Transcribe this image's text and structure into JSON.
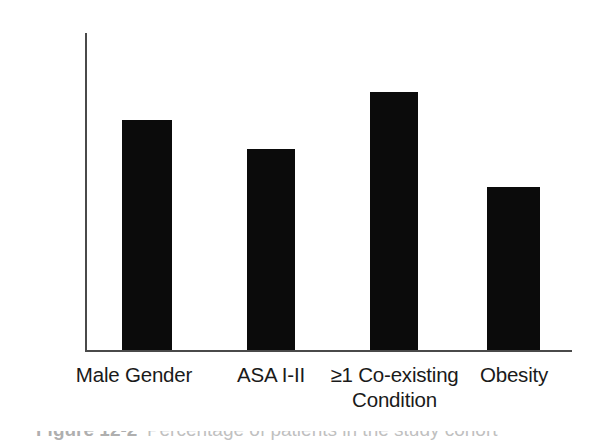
{
  "chart_data": {
    "type": "bar",
    "title": "",
    "subtitle": "",
    "xlabel": "",
    "ylabel": "",
    "categories": [
      "Male Gender",
      "ASA I-II",
      "≥1 Co-existing\nCondition",
      "Obesity"
    ],
    "values": [
      72,
      63,
      81,
      51
    ],
    "value_labels": [
      "",
      "",
      "",
      ""
    ],
    "ylim": [
      0,
      100
    ],
    "y_ticks": [
      0,
      20,
      40,
      60,
      80,
      100
    ],
    "y_tick_labels": [
      "0%",
      "20%",
      "40%",
      "60%",
      "80%",
      "100%"
    ],
    "grid": false,
    "legend": null,
    "legend_position": "none",
    "bar_color": "#0b0b0b",
    "axis_color": "#4a4a4a",
    "background_color": "#ffffff"
  },
  "caption": {
    "visible_fragment": "Figure 12-2",
    "note": "caption is cropped off at the bottom edge and is not legible"
  }
}
